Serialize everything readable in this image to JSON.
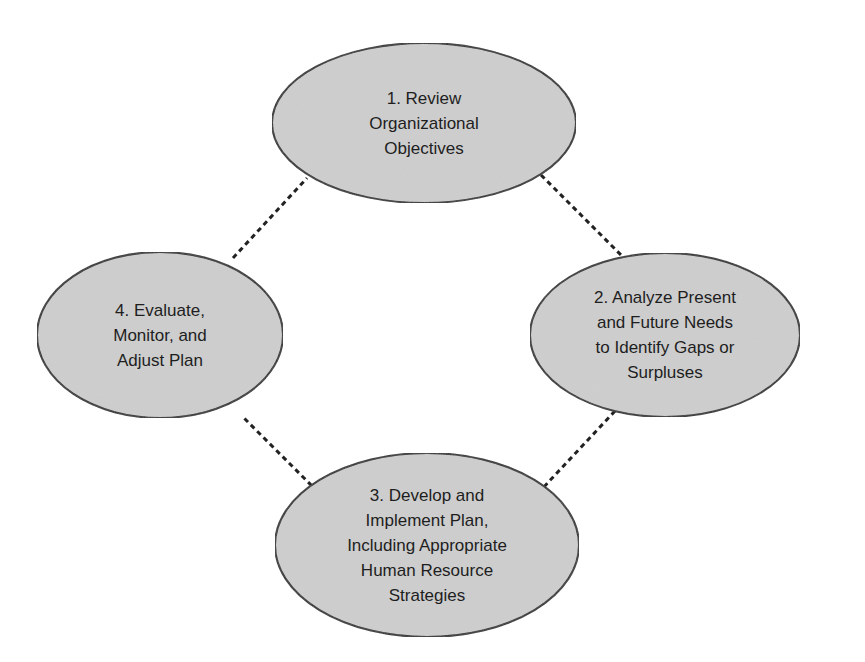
{
  "diagram": {
    "title": "",
    "colors": {
      "background": "#ffffff",
      "node_fill": "#cfcfcf",
      "node_stroke": "#2a2a2a",
      "connector": "#222222",
      "text": "#1e1e1e"
    },
    "nodes": [
      {
        "id": "1",
        "lines": [
          "1. Review",
          "Organizational",
          "Objectives"
        ],
        "shape": "ellipse",
        "cx": 424,
        "cy": 123,
        "rx": 152,
        "ry": 80
      },
      {
        "id": "2",
        "lines": [
          "2. Analyze Present",
          "and Future Needs",
          "to Identify Gaps or",
          "Surpluses"
        ],
        "shape": "ellipse",
        "cx": 665,
        "cy": 335,
        "rx": 135,
        "ry": 82
      },
      {
        "id": "3",
        "lines": [
          "3. Develop and",
          "Implement Plan,",
          "Including Appropriate",
          "Human Resource",
          "Strategies"
        ],
        "shape": "ellipse",
        "cx": 427,
        "cy": 545,
        "rx": 152,
        "ry": 92
      },
      {
        "id": "4",
        "lines": [
          "4. Evaluate,",
          "Monitor, and",
          "Adjust Plan"
        ],
        "shape": "ellipse",
        "cx": 160,
        "cy": 335,
        "rx": 123,
        "ry": 83
      }
    ],
    "edges": [
      {
        "from": "1",
        "to": "2",
        "style": "dashed",
        "x1": 541,
        "y1": 175,
        "x2": 623,
        "y2": 257
      },
      {
        "from": "2",
        "to": "3",
        "style": "dashed",
        "x1": 615,
        "y1": 411,
        "x2": 541,
        "y2": 490
      },
      {
        "from": "3",
        "to": "4",
        "style": "dashed",
        "x1": 318,
        "y1": 492,
        "x2": 242,
        "y2": 416
      },
      {
        "from": "4",
        "to": "1",
        "style": "dashed",
        "x1": 233,
        "y1": 258,
        "x2": 307,
        "y2": 178
      }
    ]
  }
}
